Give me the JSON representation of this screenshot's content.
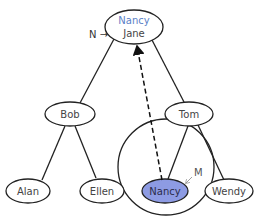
{
  "diagram": {
    "type": "tree",
    "root": {
      "top_label": "Nancy",
      "bottom_label": "Jane",
      "pointer_label": "N →",
      "top_label_color": "#5b7fc7"
    },
    "nodes": {
      "bob": "Bob",
      "tom": "Tom",
      "alan": "Alan",
      "ellen": "Ellen",
      "nancy": "Nancy",
      "wendy": "Wendy"
    },
    "highlight": {
      "node": "Nancy",
      "fill": "#8d9be3",
      "marker_label": "M"
    },
    "edges": [
      [
        "Jane",
        "Bob"
      ],
      [
        "Jane",
        "Tom"
      ],
      [
        "Bob",
        "Alan"
      ],
      [
        "Bob",
        "Ellen"
      ],
      [
        "Tom",
        "Nancy"
      ],
      [
        "Tom",
        "Wendy"
      ]
    ],
    "dashed_arrow": {
      "from": "Nancy",
      "to": "Jane"
    }
  }
}
